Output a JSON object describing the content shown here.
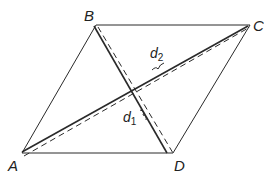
{
  "diagram": {
    "title": "",
    "type": "rhombus with diagonals",
    "colors": {
      "line": "#2a2a2a",
      "background": "#ffffff"
    },
    "vertices": [
      {
        "id": "A",
        "label": "A",
        "x": 22,
        "y": 153
      },
      {
        "id": "B",
        "label": "B",
        "x": 96,
        "y": 25
      },
      {
        "id": "C",
        "label": "C",
        "x": 250,
        "y": 25
      },
      {
        "id": "D",
        "label": "D",
        "x": 173,
        "y": 153
      }
    ],
    "edges": [
      {
        "from": "A",
        "to": "B",
        "style": "solid"
      },
      {
        "from": "B",
        "to": "C",
        "style": "solid"
      },
      {
        "from": "C",
        "to": "D",
        "style": "solid"
      },
      {
        "from": "D",
        "to": "A",
        "style": "solid"
      }
    ],
    "diagonals": [
      {
        "id": "d1",
        "from": "B",
        "to": "D",
        "label": "d",
        "subscript": "1",
        "style": "solid with dashed offset"
      },
      {
        "id": "d2",
        "from": "A",
        "to": "C",
        "label": "d",
        "subscript": "2",
        "style": "solid with dashed offset"
      }
    ]
  }
}
